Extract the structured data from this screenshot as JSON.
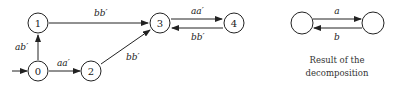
{
  "automaton": {
    "states": [
      {
        "id": "0",
        "label": "0",
        "x": 38,
        "y": 71,
        "initial": true
      },
      {
        "id": "1",
        "label": "1",
        "x": 38,
        "y": 23
      },
      {
        "id": "2",
        "label": "2",
        "x": 91,
        "y": 71
      },
      {
        "id": "3",
        "label": "3",
        "x": 160,
        "y": 23
      },
      {
        "id": "4",
        "label": "4",
        "x": 234,
        "y": 23
      }
    ],
    "transitions": [
      {
        "from": "0",
        "to": "1",
        "label": "ab′"
      },
      {
        "from": "0",
        "to": "2",
        "label": "aa′"
      },
      {
        "from": "1",
        "to": "3",
        "label": "bb′"
      },
      {
        "from": "2",
        "to": "3",
        "label": "bb′"
      },
      {
        "from": "3",
        "to": "4",
        "label": "aa′"
      },
      {
        "from": "4",
        "to": "3",
        "label": "bb′"
      }
    ]
  },
  "result": {
    "states": [
      {
        "id": "L",
        "x": 302,
        "y": 23
      },
      {
        "id": "R",
        "x": 373,
        "y": 23
      }
    ],
    "transitions": [
      {
        "from": "L",
        "to": "R",
        "label": "a"
      },
      {
        "from": "R",
        "to": "L",
        "label": "b"
      }
    ],
    "caption_line1": "Result of the",
    "caption_line2": "decomposition"
  },
  "labels": {
    "n0": "0",
    "n1": "1",
    "n2": "2",
    "n3": "3",
    "n4": "4",
    "e01": "ab′",
    "e02": "aa′",
    "e13": "bb′",
    "e23": "bb′",
    "e34": "aa′",
    "e43": "bb′",
    "ra": "a",
    "rb": "b"
  }
}
